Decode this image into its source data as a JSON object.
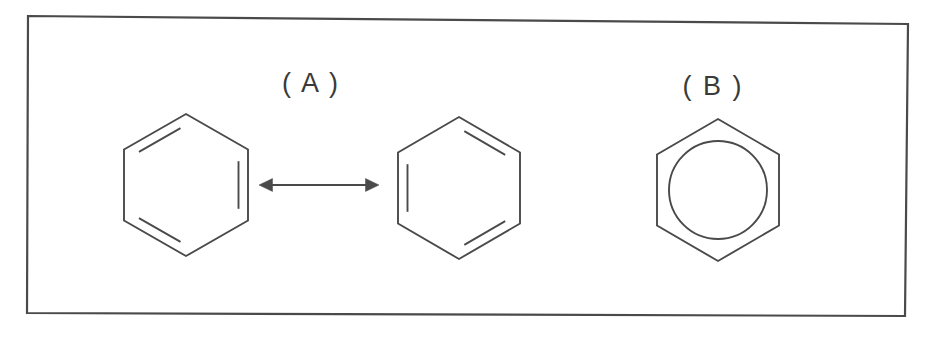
{
  "figure": {
    "background_color": "#ffffff",
    "stroke_color": "#4a4a4a",
    "label_color": "#3a3a3a",
    "frame": {
      "name": "figure-border",
      "corners": [
        [
          28,
          16
        ],
        [
          908,
          24
        ],
        [
          905,
          316
        ],
        [
          27,
          313
        ]
      ],
      "stroke_width": 2.2
    },
    "panels": [
      {
        "id": "A",
        "label": "( A )",
        "label_x": 311,
        "label_y": 92
      },
      {
        "id": "B",
        "label": "( B )",
        "label_x": 713,
        "label_y": 95
      }
    ],
    "structures": [
      {
        "name": "benzene-kekule-left",
        "panel": "A",
        "center_x": 186,
        "center_y": 185,
        "radius_x": 62,
        "radius_y": 71,
        "double_bond_edges": [
          5,
          1,
          3
        ],
        "inner_circle": false
      },
      {
        "name": "benzene-kekule-right",
        "panel": "A",
        "center_x": 459,
        "center_y": 188,
        "radius_x": 61,
        "radius_y": 71,
        "double_bond_edges": [
          0,
          2,
          4
        ],
        "inner_circle": false
      },
      {
        "name": "benzene-delocalized",
        "panel": "B",
        "center_x": 718,
        "center_y": 190,
        "radius_x": 61,
        "radius_y": 71,
        "double_bond_edges": [],
        "inner_circle": true,
        "inner_circle_radius": 49
      }
    ],
    "arrow": {
      "name": "resonance-arrow",
      "x1": 259,
      "x2": 379,
      "y": 185,
      "head_size": 9,
      "double_headed": true
    }
  }
}
